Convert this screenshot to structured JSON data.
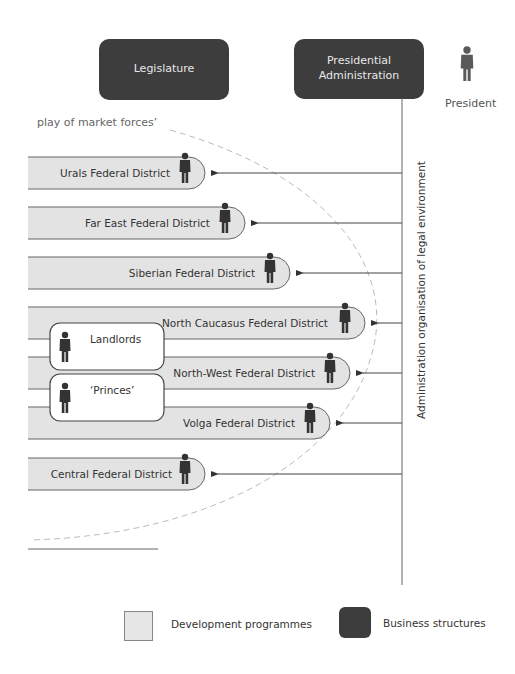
{
  "header": {
    "legislature_label": "Legislature",
    "presidential_admin_label": "Presidential Administration",
    "president_label": "President"
  },
  "market_forces_label": "play of market forces’",
  "vertical_axis_label": "Administration organisation of legal environment",
  "districts": [
    {
      "name": "Urals Federal District",
      "has_person": true
    },
    {
      "name": "Far East Federal District",
      "has_person": true
    },
    {
      "name": "Siberian Federal District",
      "has_person": true
    },
    {
      "name": "North Caucasus Federal District",
      "has_person": true
    },
    {
      "name": "North-West Federal District",
      "has_person": true
    },
    {
      "name": "Volga Federal District",
      "has_person": true
    },
    {
      "name": "Central Federal District",
      "has_person": true
    }
  ],
  "groups": [
    {
      "name": "Landlords"
    },
    {
      "name": "‘Princes’"
    }
  ],
  "legend": {
    "development_label": "Development programmes",
    "business_label": "Business structures"
  },
  "colors": {
    "dark_box": "#3d3d3d",
    "band_fill": "#e3e3e3",
    "person": "#333333"
  }
}
